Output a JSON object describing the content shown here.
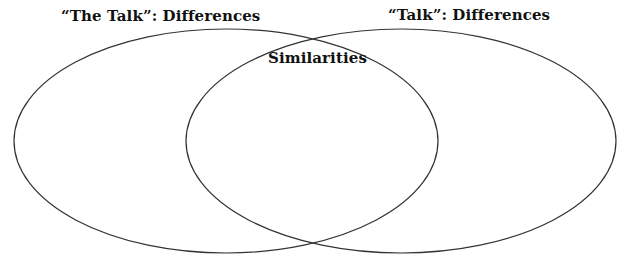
{
  "diagram": {
    "type": "venn",
    "sets": [
      {
        "id": "left",
        "label": "“The Talk”: Differences",
        "shape": "ellipse",
        "cx": 226,
        "cy": 141,
        "rx": 212,
        "ry": 112
      },
      {
        "id": "right",
        "label": "“Talk”: Differences",
        "shape": "ellipse",
        "cx": 401,
        "cy": 141,
        "rx": 215,
        "ry": 112
      }
    ],
    "intersection": {
      "label": "Similarities"
    },
    "stroke_color": "#333333",
    "background_color": "#ffffff"
  }
}
